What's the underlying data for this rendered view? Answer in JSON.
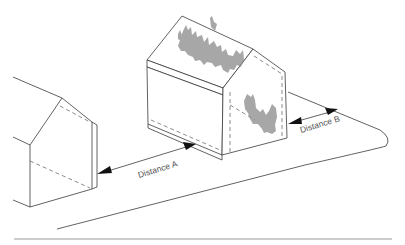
{
  "diagram": {
    "labels": {
      "distance_a": "Distance A",
      "distance_b": "Distance B"
    },
    "elements": [
      {
        "id": "neighbouring-building",
        "description": "Adjacent building with gable end facing the burning building"
      },
      {
        "id": "burning-building",
        "description": "Building with fire/smoke texture on roof and gable"
      },
      {
        "id": "boundary-line",
        "description": "Site boundary curving around the right end"
      }
    ],
    "colors": {
      "line": "#3a3a3a",
      "label": "#555555",
      "fire": "#8a8a8a",
      "rule": "#9a9a9a"
    }
  }
}
